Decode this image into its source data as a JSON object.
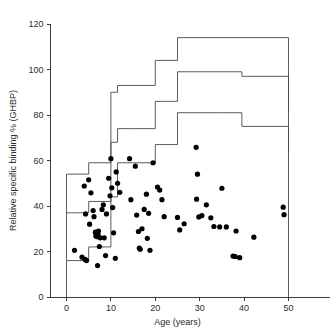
{
  "chart_data": {
    "type": "scatter",
    "title": "",
    "xlabel": "Age (years)",
    "ylabel": "Relative specific binding % (GHBP)",
    "xlim": [
      -3,
      56
    ],
    "ylim": [
      0,
      120
    ],
    "xticks": [
      0,
      10,
      20,
      30,
      40,
      50
    ],
    "yticks": [
      0,
      20,
      40,
      60,
      80,
      100,
      120
    ],
    "xtick_labels": [
      "0",
      "10",
      "20",
      "30",
      "40",
      "50"
    ],
    "ytick_labels": [
      "0",
      "20",
      "40",
      "60",
      "80",
      "100",
      "120"
    ],
    "grid": false,
    "legend": "none",
    "marker": "filled-circle",
    "marker_color": "#000000",
    "line_color": "#4a4a4a",
    "points": [
      [
        1.8,
        20.5
      ],
      [
        3.5,
        17.5
      ],
      [
        4.0,
        48.8
      ],
      [
        4.2,
        16.5
      ],
      [
        4.3,
        36.5
      ],
      [
        4.5,
        16.0
      ],
      [
        5.0,
        51.5
      ],
      [
        5.2,
        32.0
      ],
      [
        5.5,
        45.8
      ],
      [
        6.0,
        38.0
      ],
      [
        6.2,
        35.3
      ],
      [
        6.5,
        28.5
      ],
      [
        6.6,
        26.8
      ],
      [
        6.8,
        27.0
      ],
      [
        6.9,
        26.5
      ],
      [
        7.0,
        13.8
      ],
      [
        7.1,
        27.5
      ],
      [
        7.2,
        29.0
      ],
      [
        7.4,
        22.2
      ],
      [
        7.6,
        26.0
      ],
      [
        8.0,
        38.5
      ],
      [
        8.3,
        40.5
      ],
      [
        8.5,
        26.0
      ],
      [
        8.8,
        18.2
      ],
      [
        9.0,
        36.5
      ],
      [
        9.5,
        52.2
      ],
      [
        9.8,
        44.5
      ],
      [
        10.0,
        60.8
      ],
      [
        10.2,
        48.0
      ],
      [
        10.4,
        39.3
      ],
      [
        10.6,
        28.2
      ],
      [
        11.0,
        17.0
      ],
      [
        11.2,
        55.0
      ],
      [
        11.5,
        50.0
      ],
      [
        12.0,
        46.0
      ],
      [
        14.2,
        60.8
      ],
      [
        14.5,
        42.8
      ],
      [
        15.5,
        57.5
      ],
      [
        15.8,
        36.0
      ],
      [
        16.2,
        28.8
      ],
      [
        16.4,
        21.5
      ],
      [
        16.6,
        21.0
      ],
      [
        17.0,
        30.0
      ],
      [
        17.5,
        38.5
      ],
      [
        18.0,
        45.2
      ],
      [
        18.2,
        25.8
      ],
      [
        18.5,
        36.8
      ],
      [
        18.8,
        20.5
      ],
      [
        19.5,
        59.0
      ],
      [
        20.5,
        48.3
      ],
      [
        21.0,
        47.0
      ],
      [
        21.5,
        42.8
      ],
      [
        22.0,
        35.3
      ],
      [
        25.0,
        35.0
      ],
      [
        25.5,
        29.5
      ],
      [
        26.5,
        32.2
      ],
      [
        29.2,
        65.8
      ],
      [
        29.3,
        43.0
      ],
      [
        29.5,
        54.0
      ],
      [
        29.8,
        35.2
      ],
      [
        30.5,
        35.8
      ],
      [
        31.5,
        40.5
      ],
      [
        32.5,
        34.8
      ],
      [
        33.2,
        31.0
      ],
      [
        34.5,
        30.8
      ],
      [
        35.0,
        47.8
      ],
      [
        36.0,
        30.8
      ],
      [
        37.5,
        18.0
      ],
      [
        38.0,
        17.8
      ],
      [
        38.2,
        29.0
      ],
      [
        39.0,
        17.3
      ],
      [
        42.2,
        26.3
      ],
      [
        48.8,
        39.5
      ],
      [
        49.0,
        36.2
      ]
    ],
    "step_curves": [
      {
        "name": "upper-reference-band",
        "x_edges": [
          0,
          5,
          10,
          11.5,
          15,
          20,
          25,
          39.5,
          50
        ],
        "y_values": [
          54,
          59,
          90,
          93,
          93,
          104,
          114,
          114,
          100
        ]
      },
      {
        "name": "middle-reference-band",
        "x_edges": [
          0,
          5,
          10,
          11.5,
          15,
          20,
          25,
          34.5,
          39.5,
          50
        ],
        "y_values": [
          37,
          42,
          68,
          74,
          74,
          86,
          99,
          99,
          97,
          82
        ]
      },
      {
        "name": "lower-reference-band",
        "x_edges": [
          0,
          5,
          10,
          11.5,
          15,
          20,
          25,
          34.5,
          39.5,
          50
        ],
        "y_values": [
          16,
          22,
          44,
          59,
          59,
          67,
          81,
          81,
          75,
          63
        ]
      }
    ]
  }
}
